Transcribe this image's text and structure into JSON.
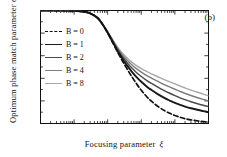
{
  "chart_data": {
    "type": "line",
    "title": "",
    "panel_label": "(b)",
    "xlabel": "Focusing  parameter",
    "xlabel_symbol": "ξ",
    "ylabel": "Optimum  phase  match  parameter",
    "ylabel_symbol": "σ",
    "ylabel_symbol_sub": "m",
    "xscale": "log",
    "yscale": "linear",
    "xlim": [
      0.01,
      1000
    ],
    "ylim": [
      0.0,
      1.0
    ],
    "grid": false,
    "legend_position": "upper-left",
    "xticks": [
      {
        "value": 0.01,
        "label": "0.01"
      },
      {
        "value": 0.1,
        "label": "0.1"
      },
      {
        "value": 1,
        "label": "1"
      },
      {
        "value": 10,
        "label": "10"
      },
      {
        "value": 100,
        "label": "100"
      },
      {
        "value": 1000,
        "label": "1000"
      }
    ],
    "yticks": [
      {
        "value": 0.0,
        "label": "0.0"
      },
      {
        "value": 0.2,
        "label": "0.2"
      },
      {
        "value": 0.4,
        "label": "0.4"
      },
      {
        "value": 0.6,
        "label": "0.6"
      },
      {
        "value": 0.8,
        "label": "0.8"
      },
      {
        "value": 1.0,
        "label": "1.0"
      }
    ],
    "x": [
      0.01,
      0.02,
      0.05,
      0.1,
      0.2,
      0.3,
      0.5,
      0.7,
      1.0,
      1.5,
      2.0,
      2.5,
      3.0,
      4.0,
      5.0,
      7.0,
      10,
      15,
      20,
      30,
      50,
      70,
      100,
      150,
      200,
      300,
      500,
      700,
      1000
    ],
    "series": [
      {
        "name": "B = 0",
        "legend_label": "B = 0",
        "B": 0,
        "color": "#111111",
        "style": "dashed",
        "width": 1.7,
        "values": [
          1.0,
          1.0,
          0.999,
          0.997,
          0.988,
          0.975,
          0.934,
          0.877,
          0.8,
          0.7,
          0.628,
          0.575,
          0.534,
          0.47,
          0.424,
          0.357,
          0.294,
          0.232,
          0.198,
          0.155,
          0.112,
          0.09,
          0.071,
          0.053,
          0.043,
          0.032,
          0.022,
          0.017,
          0.013
        ]
      },
      {
        "name": "B = 1",
        "legend_label": "B = 1",
        "B": 1,
        "color": "#1a1a1a",
        "style": "solid",
        "width": 1.9,
        "values": [
          1.0,
          1.0,
          0.999,
          0.997,
          0.988,
          0.975,
          0.934,
          0.878,
          0.803,
          0.707,
          0.64,
          0.592,
          0.556,
          0.503,
          0.466,
          0.415,
          0.369,
          0.324,
          0.297,
          0.262,
          0.224,
          0.203,
          0.182,
          0.162,
          0.15,
          0.135,
          0.119,
          0.11,
          0.1
        ]
      },
      {
        "name": "B = 2",
        "legend_label": "B = 2",
        "B": 2,
        "color": "#4a4a4a",
        "style": "solid",
        "width": 1.5,
        "values": [
          1.0,
          1.0,
          0.999,
          0.997,
          0.988,
          0.975,
          0.935,
          0.879,
          0.806,
          0.714,
          0.651,
          0.607,
          0.575,
          0.529,
          0.497,
          0.454,
          0.416,
          0.378,
          0.355,
          0.324,
          0.289,
          0.268,
          0.247,
          0.225,
          0.211,
          0.193,
          0.173,
          0.161,
          0.15
        ]
      },
      {
        "name": "B = 4",
        "legend_label": "B = 4",
        "B": 4,
        "color": "#7d7d7d",
        "style": "solid",
        "width": 1.4,
        "values": [
          1.0,
          1.0,
          0.999,
          0.997,
          0.988,
          0.976,
          0.936,
          0.881,
          0.81,
          0.722,
          0.663,
          0.623,
          0.594,
          0.553,
          0.525,
          0.488,
          0.455,
          0.422,
          0.402,
          0.375,
          0.342,
          0.323,
          0.303,
          0.281,
          0.267,
          0.248,
          0.226,
          0.213,
          0.2
        ]
      },
      {
        "name": "B = 8",
        "legend_label": "B = 8",
        "B": 8,
        "color": "#a8a8a8",
        "style": "solid",
        "width": 1.4,
        "values": [
          1.0,
          1.0,
          0.999,
          0.997,
          0.989,
          0.976,
          0.937,
          0.883,
          0.814,
          0.73,
          0.674,
          0.637,
          0.61,
          0.573,
          0.548,
          0.515,
          0.486,
          0.458,
          0.44,
          0.416,
          0.387,
          0.369,
          0.35,
          0.329,
          0.315,
          0.296,
          0.274,
          0.26,
          0.246
        ]
      }
    ]
  }
}
